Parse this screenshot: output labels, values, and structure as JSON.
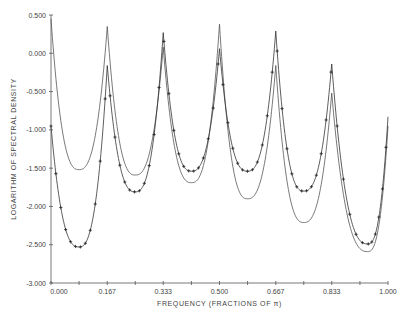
{
  "chart_data": {
    "type": "line",
    "title": "",
    "xlabel": "FREQUENCY (FRACTIONS OF π)",
    "ylabel": "LOGARITHM OF SPECTRAL DENSITY",
    "xlim": [
      0,
      1
    ],
    "ylim": [
      -3.0,
      0.5
    ],
    "grid": false,
    "legend": null,
    "x_ticks": [
      0.0,
      0.167,
      0.333,
      0.5,
      0.667,
      0.833,
      1.0
    ],
    "x_tick_labels": [
      "0.000",
      "0.167",
      "0.333",
      "0.500",
      "0.667",
      "0.833",
      "1.000"
    ],
    "x_minor_ticks": [
      0.0833,
      0.25,
      0.4167,
      0.5833,
      0.75,
      0.9167
    ],
    "y_ticks": [
      0.5,
      0.0,
      -0.5,
      -1.0,
      -1.5,
      -2.0,
      -2.5,
      -3.0
    ],
    "y_tick_labels": [
      "0.500",
      "0.000",
      "-0.500",
      "-1.000",
      "-1.500",
      "-2.000",
      "-2.500",
      "-3.000"
    ],
    "series": [
      {
        "name": "spectrum-plain",
        "marker": "none",
        "color": "#555555",
        "x": [
          0.0,
          0.083,
          0.167,
          0.25,
          0.333,
          0.417,
          0.5,
          0.583,
          0.667,
          0.75,
          0.833,
          0.94,
          1.0
        ],
        "values": [
          0.45,
          -1.52,
          0.35,
          -1.59,
          0.08,
          -1.69,
          0.38,
          -1.9,
          -0.16,
          -2.21,
          -0.52,
          -2.59,
          -0.95
        ]
      },
      {
        "name": "spectrum-marked",
        "marker": "plus",
        "color": "#333333",
        "x": [
          0.0,
          0.083,
          0.167,
          0.25,
          0.333,
          0.417,
          0.5,
          0.583,
          0.667,
          0.75,
          0.833,
          0.94,
          1.0
        ],
        "values": [
          -0.95,
          -2.53,
          -0.16,
          -1.81,
          0.27,
          -1.54,
          0.06,
          -1.54,
          0.29,
          -1.8,
          -0.14,
          -2.49,
          -0.83
        ]
      }
    ]
  },
  "plot_area": {
    "x0": 51,
    "x1": 388,
    "y_top": 15,
    "y_bottom": 283
  }
}
